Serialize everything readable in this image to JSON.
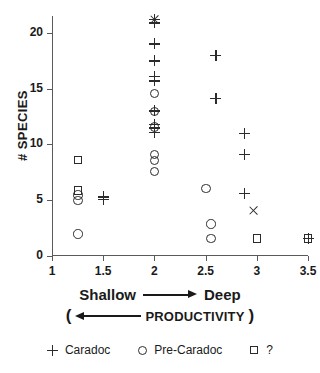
{
  "chart_data": {
    "type": "scatter",
    "title": "",
    "xlabel": "Shallow → Deep  ( ← PRODUCTIVITY)",
    "ylabel": "# SPECIES",
    "xlim": [
      1,
      3.5
    ],
    "ylim": [
      0,
      21.5
    ],
    "xticks": [
      1,
      1.5,
      2,
      2.5,
      3,
      3.5
    ],
    "xtick_labels": [
      "1",
      "1.5",
      "2",
      "2.5",
      "3",
      "3.5"
    ],
    "yticks": [
      0,
      5,
      10,
      15,
      20
    ],
    "ytick_labels": [
      "0",
      "5",
      "10",
      "15",
      "20"
    ],
    "grid": false,
    "legend_position": "below",
    "series": [
      {
        "name": "Caradoc",
        "marker": "plus",
        "points": [
          [
            1.5,
            5.3
          ],
          [
            1.5,
            5.1
          ],
          [
            2.0,
            21.2
          ],
          [
            2.0,
            20.9
          ],
          [
            2.0,
            19.0
          ],
          [
            2.0,
            17.5
          ],
          [
            2.0,
            16.1
          ],
          [
            2.0,
            15.7
          ],
          [
            2.0,
            13.0
          ],
          [
            2.0,
            11.8
          ],
          [
            2.0,
            11.5
          ],
          [
            2.0,
            11.1
          ],
          [
            2.6,
            18.0
          ],
          [
            2.6,
            14.1
          ],
          [
            2.88,
            11.0
          ],
          [
            2.88,
            9.1
          ],
          [
            2.88,
            5.6
          ],
          [
            3.5,
            1.6
          ]
        ]
      },
      {
        "name": "Pre-Caradoc",
        "marker": "circle",
        "points": [
          [
            1.25,
            5.5
          ],
          [
            1.25,
            5.0
          ],
          [
            1.25,
            2.0
          ],
          [
            2.0,
            14.6
          ],
          [
            2.0,
            13.0
          ],
          [
            2.0,
            11.6
          ],
          [
            2.0,
            9.1
          ],
          [
            2.0,
            8.6
          ],
          [
            2.0,
            7.6
          ],
          [
            2.5,
            6.1
          ],
          [
            2.55,
            2.9
          ],
          [
            2.55,
            1.6
          ]
        ]
      },
      {
        "name": "?",
        "marker": "square",
        "points": [
          [
            1.25,
            8.6
          ],
          [
            1.25,
            5.9
          ],
          [
            3.0,
            1.6
          ],
          [
            3.5,
            1.6
          ]
        ]
      },
      {
        "name": "overlap",
        "marker": "cross",
        "points": [
          [
            2.0,
            21.2
          ],
          [
            2.97,
            4.1
          ]
        ]
      }
    ]
  },
  "axis_annotation": {
    "shallow": "Shallow",
    "deep": "Deep",
    "open_paren": "(",
    "productivity": "PRODUCTIVITY",
    "close_paren": ")"
  },
  "legend": {
    "items": [
      {
        "symbol": "plus-marker",
        "label": "Caradoc"
      },
      {
        "symbol": "circle-marker",
        "label": "Pre-Caradoc"
      },
      {
        "symbol": "square-marker",
        "label": "?"
      }
    ]
  },
  "colors": {
    "marker": "#2b2b2b",
    "axis": "#5a5a5a",
    "text": "#1a1a1a",
    "background": "#ffffff"
  }
}
